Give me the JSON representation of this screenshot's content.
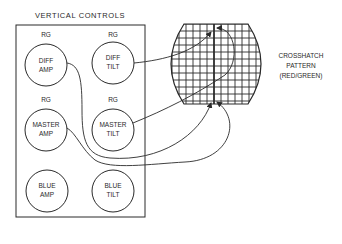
{
  "panel": {
    "title": "VERTICAL CONTROLS",
    "controls": [
      {
        "id": "diff-amp",
        "badge": "RG",
        "line1": "DIFF",
        "line2": "AMP"
      },
      {
        "id": "diff-tilt",
        "badge": "RG",
        "line1": "DIFF",
        "line2": "TILT"
      },
      {
        "id": "master-amp",
        "badge": "RG",
        "line1": "MASTER",
        "line2": "AMP"
      },
      {
        "id": "master-tilt",
        "badge": "RG",
        "line1": "MASTER",
        "line2": "TILT"
      },
      {
        "id": "blue-amp",
        "badge": "",
        "line1": "BLUE",
        "line2": "AMP"
      },
      {
        "id": "blue-tilt",
        "badge": "",
        "line1": "BLUE",
        "line2": "TILT"
      }
    ]
  },
  "screen": {
    "label_line1": "CROSSHATCH",
    "label_line2": "PATTERN",
    "label_line3": "(RED/GREEN)"
  },
  "colors": {
    "ink": "#2a2a2a",
    "background": "#ffffff"
  }
}
